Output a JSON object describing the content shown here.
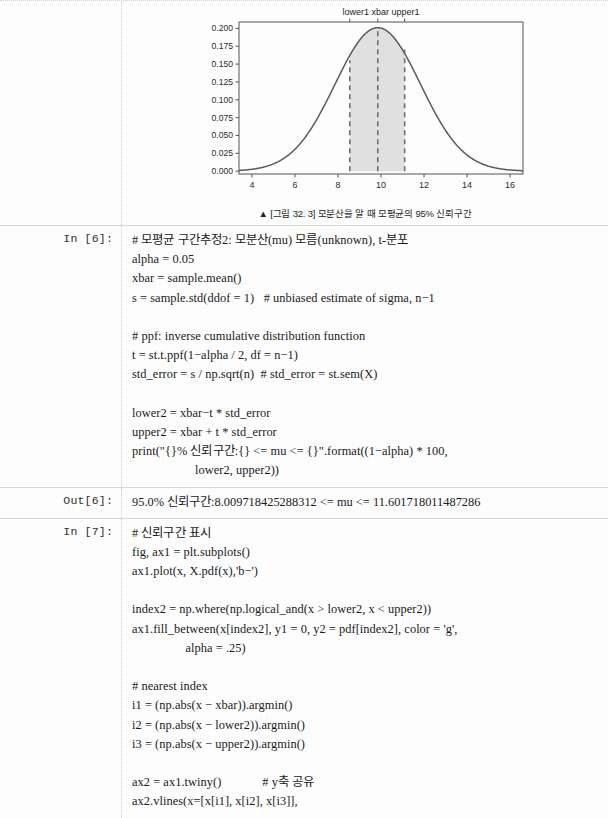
{
  "page": {
    "background": "#fdfdfd",
    "text_color": "#1a1a1a"
  },
  "figure_cell": {
    "name": "figure-output-cell",
    "caption": "▲ [그림 32. 3] 모분산을 알 때 모평균의 95% 신뢰구간"
  },
  "chart_data": {
    "type": "line",
    "title": "",
    "top_axis_title": "lower1 xbar upper1",
    "top_tick_labels": [
      "lower1",
      "xbar",
      "upper1"
    ],
    "top_tick_x": [
      8.55,
      9.85,
      11.1
    ],
    "xlabel": "",
    "ylabel": "",
    "xlim": [
      3.4,
      16.6
    ],
    "ylim": [
      -0.004,
      0.209
    ],
    "xticks": [
      4,
      6,
      8,
      10,
      12,
      14,
      16
    ],
    "xtick_labels": [
      "4",
      "6",
      "8",
      "10",
      "12",
      "14",
      "16"
    ],
    "yticks": [
      0.0,
      0.025,
      0.05,
      0.075,
      0.1,
      0.125,
      0.15,
      0.175,
      0.2
    ],
    "ytick_labels": [
      "0.000",
      "0.025",
      "0.050",
      "0.075",
      "0.100",
      "0.125",
      "0.150",
      "0.175",
      "0.200"
    ],
    "grid": false,
    "legend": null,
    "series": [
      {
        "name": "normal pdf",
        "kind": "line",
        "color": "#5a5a5a",
        "linestyle": "solid",
        "mu": 9.85,
        "sigma": 1.985,
        "peak_x": 9.85,
        "peak_y": 0.2009
      }
    ],
    "shaded_region": {
      "name": "confidence-interval-fill",
      "x_from": 8.55,
      "x_to": 11.1,
      "color": "#c9c9c9",
      "alpha": 0.55
    },
    "vlines": [
      {
        "label": "lower1",
        "x": 8.55,
        "y_top": 0.1555,
        "color": "#6e6e6e",
        "linestyle": "dashed"
      },
      {
        "label": "xbar",
        "x": 9.85,
        "y_top": 0.2009,
        "color": "#6e6e6e",
        "linestyle": "dashed"
      },
      {
        "label": "upper1",
        "x": 11.1,
        "y_top": 0.1703,
        "color": "#6e6e6e",
        "linestyle": "dashed"
      }
    ]
  },
  "cells": [
    {
      "name": "in-6",
      "prompt_label": "In [6]:",
      "type": "input",
      "lines": [
        "# 모평균 구간추정2: 모분산(mu) 모름(unknown), t-분포",
        "alpha = 0.05",
        "xbar = sample.mean()",
        "s = sample.std(ddof = 1)   # unbiased estimate of sigma, n−1",
        "",
        "# ppf: inverse cumulative distribution function",
        "t = st.t.ppf(1−alpha / 2, df = n−1)",
        "std_error = s / np.sqrt(n)  # std_error = st.sem(X)",
        "",
        "lower2 = xbar−t * std_error",
        "upper2 = xbar + t * std_error",
        "print(\"{}% 신뢰구간:{} <= mu <= {}\".format((1−alpha) * 100,",
        "                    lower2, upper2))"
      ]
    },
    {
      "name": "out-6",
      "prompt_label": "Out[6]:",
      "type": "output",
      "lines": [
        "95.0% 신뢰구간:8.009718425288312 <= mu <= 11.601718011487286"
      ]
    },
    {
      "name": "in-7",
      "prompt_label": "In [7]:",
      "type": "input",
      "lines": [
        "# 신뢰구간 표시",
        "fig, ax1 = plt.subplots()",
        "ax1.plot(x, X.pdf(x),'b−')",
        "",
        "index2 = np.where(np.logical_and(x > lower2, x < upper2))",
        "ax1.fill_between(x[index2], y1 = 0, y2 = pdf[index2], color = 'g',",
        "                 alpha = .25)",
        "",
        "# nearest index",
        "i1 = (np.abs(x − xbar)).argmin()",
        "i2 = (np.abs(x − lower2)).argmin()",
        "i3 = (np.abs(x − upper2)).argmin()",
        "",
        "ax2 = ax1.twiny()             # y축 공유",
        "ax2.vlines(x=[x[i1], x[i2], x[i3]],"
      ]
    }
  ]
}
